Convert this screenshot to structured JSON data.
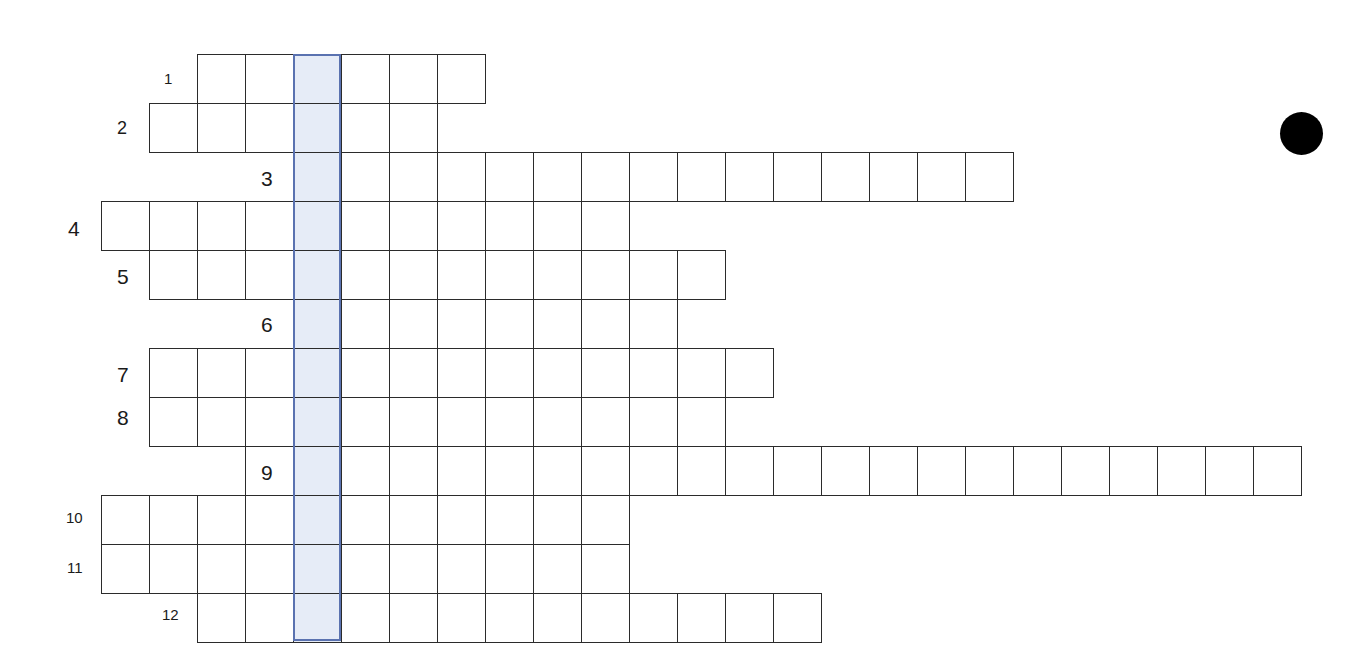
{
  "puzzle": {
    "type": "crossword-keyword-grid",
    "grid": {
      "origin_x": 101,
      "origin_y": 54,
      "cell_width": 48,
      "cell_height": 49,
      "key_column_index": 4,
      "colors": {
        "cell_border": "#2b2b2b",
        "cell_fill": "#ffffff",
        "key_fill": "#e6ecf7",
        "key_border": "#5a72b0",
        "dot": "#000000"
      }
    },
    "rows": [
      {
        "number": "1",
        "label_size": "small",
        "label_x": 164,
        "label_y": 71,
        "start_col": 2,
        "length": 6
      },
      {
        "number": "2",
        "label_size": "medium",
        "label_x": 117,
        "label_y": 119,
        "start_col": 1,
        "length": 6
      },
      {
        "number": "3",
        "label_size": "large",
        "label_x": 261,
        "label_y": 168,
        "start_col": 4,
        "length": 15
      },
      {
        "number": "4",
        "label_size": "large",
        "label_x": 68,
        "label_y": 218,
        "start_col": 0,
        "length": 11
      },
      {
        "number": "5",
        "label_size": "large",
        "label_x": 117,
        "label_y": 266,
        "start_col": 1,
        "length": 12
      },
      {
        "number": "6",
        "label_size": "large",
        "label_x": 261,
        "label_y": 314,
        "start_col": 4,
        "length": 8
      },
      {
        "number": "7",
        "label_size": "large",
        "label_x": 117,
        "label_y": 364,
        "start_col": 1,
        "length": 13
      },
      {
        "number": "8",
        "label_size": "large",
        "label_x": 117,
        "label_y": 407,
        "start_col": 1,
        "length": 12
      },
      {
        "number": "9",
        "label_size": "large",
        "label_x": 261,
        "label_y": 462,
        "start_col": 4,
        "length": 21
      },
      {
        "number": "10",
        "label_size": "small",
        "label_x": 66,
        "label_y": 510,
        "start_col": 0,
        "length": 11
      },
      {
        "number": "11",
        "label_size": "small",
        "label_x": 67,
        "label_y": 560,
        "start_col": 0,
        "length": 11
      },
      {
        "number": "12",
        "label_size": "small",
        "label_x": 162,
        "label_y": 607,
        "start_col": 2,
        "length": 13
      }
    ],
    "dot": {
      "visible": true
    }
  }
}
